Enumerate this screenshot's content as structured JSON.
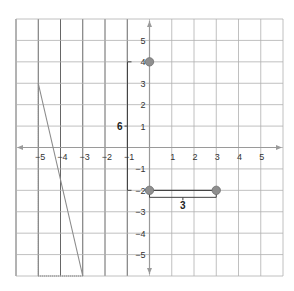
{
  "diagram": {
    "type": "coordinate-plane",
    "grid": {
      "x_min": -6,
      "x_max": 6,
      "y_min": -6,
      "y_max": 6,
      "step": 1
    },
    "colors": {
      "grid": "#b0b0b0",
      "grid_dark": "#555555",
      "axis": "#9a9a9a",
      "point_fill": "#8f8f8f",
      "point_stroke": "#6e6e6e",
      "segment": "#444444",
      "triangle": "#8a8a8a"
    },
    "x_axis_labels": [
      "−5",
      "−4",
      "−3",
      "−2",
      "−1",
      "1",
      "2",
      "3",
      "4",
      "5"
    ],
    "y_axis_labels": [
      "5",
      "4",
      "3",
      "2",
      "1",
      "−1",
      "−2",
      "−3",
      "−4",
      "−5"
    ],
    "points": [
      {
        "name": "point-0-4",
        "x": 0,
        "y": 4
      },
      {
        "name": "point-0-neg2",
        "x": 0,
        "y": -2
      },
      {
        "name": "point-3-neg2",
        "x": 3,
        "y": -2
      }
    ],
    "horizontal_measure": {
      "from": [
        0,
        -2
      ],
      "to": [
        3,
        -2
      ],
      "label": "3"
    },
    "vertical_measure": {
      "from": [
        0,
        4
      ],
      "to": [
        0,
        -2
      ],
      "label": "6"
    },
    "triangle": {
      "vertices": [
        [
          -5,
          3
        ],
        [
          -5,
          -6
        ],
        [
          -3,
          -6
        ]
      ]
    }
  }
}
